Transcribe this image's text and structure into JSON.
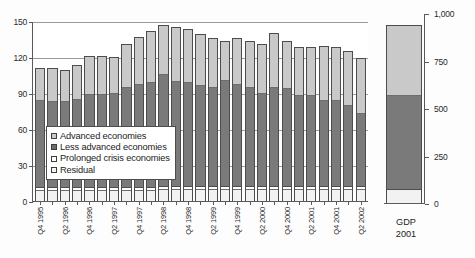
{
  "chart_data": {
    "type": "bar",
    "title": "",
    "subtitle": "",
    "xlabel": "",
    "ylabel": "",
    "ylim": [
      0,
      150
    ],
    "yticks": [
      0,
      30,
      60,
      90,
      120,
      150
    ],
    "ytick_labels": [
      "0",
      "30",
      "60",
      "90",
      "120",
      "150"
    ],
    "grid": true,
    "stacked": true,
    "legend_position": "inside-lower-left",
    "legend_entries": [
      "Advanced economies",
      "Less advanced economies",
      "Prolonged crisis economies",
      "Residual"
    ],
    "colors": {
      "advanced": "#c9c9c9",
      "less_advanced": "#7a7a7a",
      "prolonged_crisis": "#ffffff",
      "residual": "#f2f2f2",
      "axis": "#5a5a5a",
      "gridline": "#9a9a9a"
    },
    "categories": [
      "Q4 1995",
      "Q1 1996",
      "Q2 1996",
      "Q3 1996",
      "Q4 1996",
      "Q1 1997",
      "Q2 1997",
      "Q3 1997",
      "Q4 1997",
      "Q1 1998",
      "Q2 1998",
      "Q3 1998",
      "Q4 1998",
      "Q1 1999",
      "Q2 1999",
      "Q3 1999",
      "Q4 1999",
      "Q1 2000",
      "Q2 2000",
      "Q3 2000",
      "Q4 2000",
      "Q1 2001",
      "Q2 2001",
      "Q3 2001",
      "Q4 2001",
      "Q1 2002",
      "Q2 2002"
    ],
    "tick_labels_shown": [
      "Q4 1995",
      "",
      "Q2 1996",
      "",
      "Q4 1996",
      "",
      "Q2 1997",
      "",
      "Q4 1997",
      "",
      "Q2 1998",
      "",
      "Q4 1998",
      "",
      "Q2 1999",
      "",
      "Q4 1999",
      "",
      "Q2 2000",
      "",
      "Q4 2000",
      "",
      "Q2 2001",
      "",
      "Q4 2001",
      "",
      "Q2 2002"
    ],
    "series": [
      {
        "name": "Residual",
        "key": "residual",
        "values": [
          8,
          8,
          8,
          8,
          8,
          8,
          8,
          8,
          8,
          8,
          9,
          9,
          9,
          9,
          9,
          9,
          9,
          9,
          9,
          9,
          9,
          9,
          9,
          9,
          9,
          9,
          9
        ]
      },
      {
        "name": "Prolonged crisis economies",
        "key": "prolonged_crisis",
        "values": [
          3,
          3,
          3,
          3,
          3,
          3,
          3,
          3,
          3,
          3,
          3,
          3,
          3,
          3,
          3,
          3,
          3,
          3,
          3,
          3,
          3,
          3,
          3,
          3,
          3,
          3,
          3
        ]
      },
      {
        "name": "Less advanced economies",
        "key": "less_advanced",
        "values": [
          73,
          72,
          72,
          74,
          78,
          78,
          79,
          84,
          86,
          88,
          94,
          88,
          87,
          84,
          83,
          89,
          85,
          83,
          78,
          83,
          82,
          76,
          76,
          72,
          72,
          68,
          61
        ]
      },
      {
        "name": "Advanced economies",
        "key": "advanced",
        "values": [
          27,
          28,
          26,
          28,
          32,
          32,
          30,
          36,
          40,
          43,
          41,
          45,
          44,
          43,
          41,
          32,
          39,
          38,
          41,
          45,
          39,
          40,
          40,
          45,
          44,
          45,
          46
        ]
      }
    ],
    "totals": [
      111,
      111,
      109,
      113,
      121,
      121,
      120,
      131,
      137,
      142,
      147,
      145,
      143,
      139,
      136,
      133,
      136,
      133,
      131,
      140,
      133,
      128,
      128,
      129,
      128,
      125,
      119
    ]
  },
  "gdp_panel": {
    "caption_line1": "GDP",
    "caption_line2": "2001",
    "ylim": [
      0,
      1000
    ],
    "yticks": [
      0,
      250,
      500,
      750,
      1000
    ],
    "ytick_labels": [
      "0",
      "250",
      "500",
      "750",
      "1,000"
    ],
    "segments": [
      {
        "name": "Residual",
        "key": "residual",
        "value": 70
      },
      {
        "name": "Prolonged crisis economies",
        "key": "prolonged_crisis",
        "value": 0
      },
      {
        "name": "Less advanced economies",
        "key": "less_advanced",
        "value": 495
      },
      {
        "name": "Advanced economies",
        "key": "advanced",
        "value": 370
      }
    ],
    "total": 935
  }
}
